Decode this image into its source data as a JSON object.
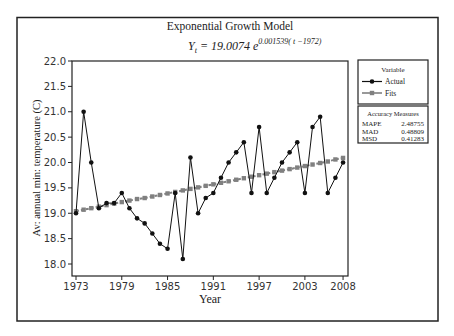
{
  "chart_data": {
    "type": "line",
    "title": "Exponential Growth Model",
    "subtitle": {
      "lhs": "Y",
      "lhs_sub": "t",
      "rhs_coef": "= 19.0074 e",
      "rhs_exp": "0.001539( t −1972)"
    },
    "xlabel": "Year",
    "ylabel": "Av: annual min: temperature (C)",
    "x_tick_labels": [
      "1973",
      "1979",
      "1985",
      "1991",
      "1997",
      "2003",
      "2008"
    ],
    "y_tick_labels": [
      "18.0",
      "18.5",
      "19.0",
      "19.5",
      "20.0",
      "20.5",
      "21.0",
      "21.5",
      "22.0"
    ],
    "ylim": [
      17.75,
      22.0
    ],
    "xlim": [
      1972.5,
      2008.6
    ],
    "grid": false,
    "legend_position": "right",
    "x": [
      1973,
      1974,
      1975,
      1976,
      1977,
      1978,
      1979,
      1980,
      1981,
      1982,
      1983,
      1984,
      1985,
      1986,
      1987,
      1988,
      1989,
      1990,
      1991,
      1992,
      1993,
      1994,
      1995,
      1996,
      1997,
      1998,
      1999,
      2000,
      2001,
      2002,
      2003,
      2004,
      2005,
      2006,
      2007,
      2008
    ],
    "series": [
      {
        "name": "Actual",
        "style": "solid-line-circle-markers",
        "color": "#111111",
        "values": [
          19.0,
          21.0,
          20.0,
          19.1,
          19.2,
          19.2,
          19.4,
          19.1,
          18.9,
          18.8,
          18.6,
          18.4,
          18.3,
          19.4,
          18.1,
          20.1,
          19.0,
          19.3,
          19.4,
          19.7,
          20.0,
          20.2,
          20.4,
          19.4,
          20.7,
          19.4,
          19.7,
          20.0,
          20.2,
          20.4,
          19.4,
          20.7,
          20.9,
          19.4,
          19.7,
          20.0
        ]
      },
      {
        "name": "Fits",
        "style": "dashed-line-square-markers",
        "color": "#808080",
        "values": [
          19.04,
          19.07,
          19.1,
          19.13,
          19.16,
          19.19,
          19.22,
          19.25,
          19.28,
          19.3,
          19.33,
          19.36,
          19.39,
          19.42,
          19.45,
          19.48,
          19.51,
          19.54,
          19.57,
          19.6,
          19.63,
          19.66,
          19.69,
          19.72,
          19.75,
          19.78,
          19.81,
          19.84,
          19.87,
          19.9,
          19.93,
          19.96,
          19.99,
          20.02,
          20.06,
          20.09
        ]
      }
    ],
    "legend": {
      "title": "Variable",
      "entries": [
        "Actual",
        "Fits"
      ]
    },
    "accuracy_measures": {
      "title": "Accuracy Measures",
      "rows": [
        {
          "label": "MAPE",
          "value": "2.48755"
        },
        {
          "label": "MAD",
          "value": "0.48809"
        },
        {
          "label": "MSD",
          "value": "0.41283"
        }
      ]
    }
  }
}
